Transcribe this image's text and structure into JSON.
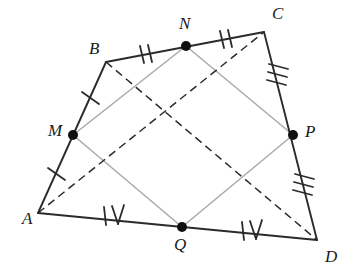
{
  "figure": {
    "canvas": {
      "width": 351,
      "height": 277
    },
    "colors": {
      "outline": "#2b2b2b",
      "inner": "#a9a9a9",
      "dashed": "#2b2b2b",
      "point": "#101010",
      "background": "#ffffff",
      "label": "#1a1a1a"
    },
    "vertices": [
      {
        "id": "A",
        "label": "A",
        "x": 38,
        "y": 213,
        "label_x": 22,
        "label_y": 210
      },
      {
        "id": "B",
        "label": "B",
        "x": 106,
        "y": 62,
        "label_x": 89,
        "label_y": 40
      },
      {
        "id": "C",
        "label": "C",
        "x": 264,
        "y": 32,
        "label_x": 272,
        "label_y": 5
      },
      {
        "id": "D",
        "label": "D",
        "x": 317,
        "y": 240,
        "label_x": 325,
        "label_y": 248
      }
    ],
    "midpoints": [
      {
        "id": "M",
        "label": "M",
        "x": 73,
        "y": 135,
        "on": "AB",
        "label_x": 48,
        "label_y": 122
      },
      {
        "id": "N",
        "label": "N",
        "x": 186,
        "y": 46,
        "on": "BC",
        "label_x": 179,
        "label_y": 15
      },
      {
        "id": "P",
        "label": "P",
        "x": 293,
        "y": 135,
        "on": "CD",
        "label_x": 305,
        "label_y": 123
      },
      {
        "id": "Q",
        "label": "Q",
        "x": 182,
        "y": 227,
        "on": "DA",
        "label_x": 174,
        "label_y": 236
      }
    ],
    "outline_edges": [
      {
        "id": "A-M",
        "from": "A",
        "to": "M"
      },
      {
        "id": "M-B",
        "from": "M",
        "to": "B"
      },
      {
        "id": "B-N",
        "from": "B",
        "to": "N"
      },
      {
        "id": "N-C",
        "from": "N",
        "to": "C"
      },
      {
        "id": "C-P",
        "from": "C",
        "to": "P"
      },
      {
        "id": "P-D",
        "from": "P",
        "to": "D"
      },
      {
        "id": "D-Q",
        "from": "D",
        "to": "Q"
      },
      {
        "id": "Q-A",
        "from": "Q",
        "to": "A"
      }
    ],
    "inner_edges": [
      {
        "id": "M-N",
        "from": "M",
        "to": "N"
      },
      {
        "id": "N-P",
        "from": "N",
        "to": "P"
      },
      {
        "id": "P-Q",
        "from": "P",
        "to": "Q"
      },
      {
        "id": "Q-M",
        "from": "Q",
        "to": "M"
      }
    ],
    "diagonals": [
      {
        "id": "A-C",
        "from": "A",
        "to": "C",
        "style": "dashed"
      },
      {
        "id": "B-D",
        "from": "B",
        "to": "D",
        "style": "dashed"
      }
    ],
    "tick_marks": [
      {
        "id": "tick-AM",
        "segment": "A-M",
        "count": 1,
        "style": "strokes",
        "x": 56,
        "y": 174
      },
      {
        "id": "tick-MB",
        "segment": "M-B",
        "count": 1,
        "style": "strokes",
        "x": 90,
        "y": 98
      },
      {
        "id": "tick-BN",
        "segment": "B-N",
        "count": 2,
        "style": "strokes",
        "x": 146,
        "y": 54
      },
      {
        "id": "tick-NC",
        "segment": "N-C",
        "count": 2,
        "style": "strokes",
        "x": 226,
        "y": 39
      },
      {
        "id": "tick-CP",
        "segment": "C-P",
        "count": 3,
        "style": "strokes",
        "x": 278,
        "y": 74
      },
      {
        "id": "tick-PD",
        "segment": "P-D",
        "count": 3,
        "style": "strokes",
        "x": 304,
        "y": 184
      },
      {
        "id": "tick-AQ",
        "segment": "A-Q",
        "count": 4,
        "style": "roman-four",
        "x": 111,
        "y": 216
      },
      {
        "id": "tick-QD",
        "segment": "Q-D",
        "count": 4,
        "style": "roman-four",
        "x": 249,
        "y": 230
      }
    ]
  }
}
